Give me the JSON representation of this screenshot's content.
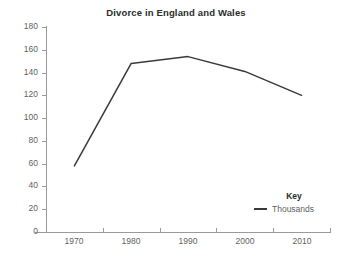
{
  "chart_data": {
    "type": "line",
    "title": "Divorce in England and Wales",
    "xlabel": "",
    "ylabel": "",
    "x": [
      1970,
      1980,
      1990,
      2000,
      2010
    ],
    "categories": [
      "1970",
      "1980",
      "1990",
      "2000",
      "2010"
    ],
    "series": [
      {
        "name": "Thousands",
        "values": [
          58,
          148,
          154,
          141,
          120
        ],
        "color": "#3a3a3a"
      }
    ],
    "xlim": [
      1965,
      2015
    ],
    "ylim": [
      0,
      180
    ],
    "ytick_labels": [
      "0",
      "20",
      "40",
      "60",
      "80",
      "100",
      "120",
      "140",
      "160",
      "180"
    ],
    "ytick_values": [
      0,
      20,
      40,
      60,
      80,
      100,
      120,
      140,
      160,
      180
    ],
    "xtick_labels": [
      "1970",
      "1980",
      "1990",
      "2000",
      "2010"
    ],
    "grid": false,
    "legend_position": "inside-bottom-right",
    "legend_title": "Key",
    "legend_entries": [
      "Thousands"
    ]
  },
  "colors": {
    "line": "#3a3a3a",
    "axis": "#9a9a9a",
    "tick_text": "#5f5f5f",
    "title_text": "#2b2b2b",
    "background": "#ffffff"
  }
}
